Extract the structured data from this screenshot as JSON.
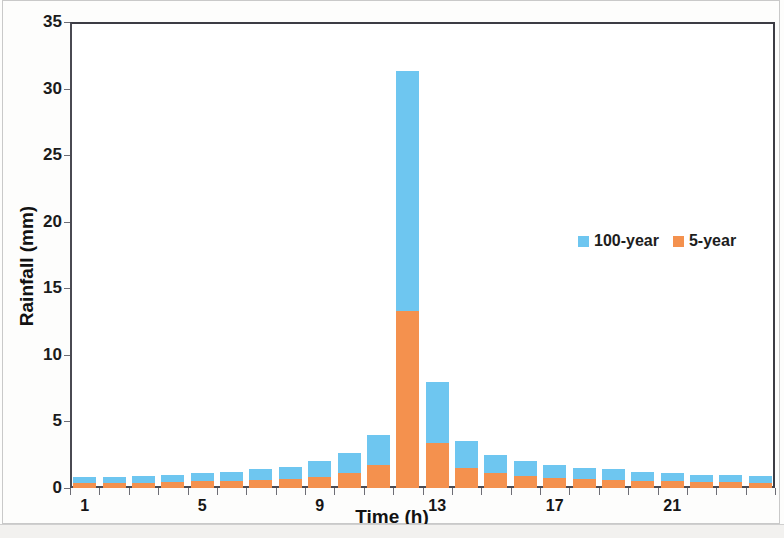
{
  "chart_data": {
    "type": "bar",
    "title": "",
    "subtitle": "",
    "xlabel": "Time (h)",
    "ylabel": "Rainfall (mm)",
    "stacked": false,
    "overlapped": true,
    "grid": false,
    "legend_position": "inside-right",
    "xlim": [
      0.5,
      24.5
    ],
    "ylim": [
      0,
      35
    ],
    "y_ticks": [
      0,
      5,
      10,
      15,
      20,
      25,
      30,
      35
    ],
    "x_ticks": [
      1,
      5,
      9,
      13,
      17,
      21
    ],
    "x": [
      1,
      2,
      3,
      4,
      5,
      6,
      7,
      8,
      9,
      10,
      11,
      12,
      13,
      14,
      15,
      16,
      17,
      18,
      19,
      20,
      21,
      22,
      23,
      24
    ],
    "categories": [
      "1",
      "2",
      "3",
      "4",
      "5",
      "6",
      "7",
      "8",
      "9",
      "10",
      "11",
      "12",
      "13",
      "14",
      "15",
      "16",
      "17",
      "18",
      "19",
      "20",
      "21",
      "22",
      "23",
      "24"
    ],
    "series": [
      {
        "name": "100-year",
        "color": "#6ec6f0",
        "values": [
          0.8,
          0.8,
          0.9,
          1.0,
          1.1,
          1.2,
          1.4,
          1.6,
          2.0,
          2.6,
          4.0,
          31.3,
          8.0,
          3.5,
          2.5,
          2.0,
          1.7,
          1.5,
          1.4,
          1.2,
          1.1,
          1.0,
          1.0,
          0.9
        ]
      },
      {
        "name": "5-year",
        "color": "#f4914e",
        "values": [
          0.35,
          0.35,
          0.4,
          0.45,
          0.5,
          0.55,
          0.6,
          0.7,
          0.85,
          1.1,
          1.7,
          13.3,
          3.4,
          1.5,
          1.1,
          0.9,
          0.75,
          0.65,
          0.6,
          0.55,
          0.5,
          0.45,
          0.45,
          0.4
        ]
      }
    ]
  },
  "axes": {
    "y_title": "Rainfall (mm)",
    "x_title": "Time (h)",
    "y_tick_labels": [
      "35",
      "30",
      "25",
      "20",
      "15",
      "10",
      "5",
      "0"
    ],
    "x_tick_labels": [
      "1",
      "5",
      "9",
      "13",
      "17",
      "21"
    ]
  },
  "legend": {
    "items": [
      {
        "label": "100-year",
        "color": "#6ec6f0"
      },
      {
        "label": "5-year",
        "color": "#f4914e"
      }
    ]
  }
}
